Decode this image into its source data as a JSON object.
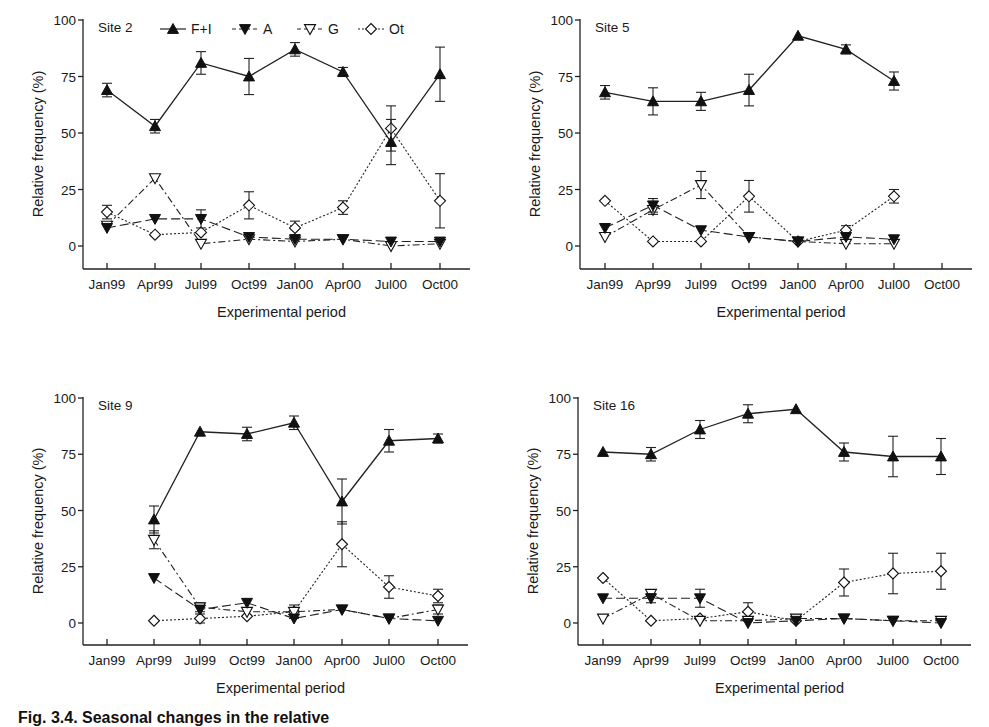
{
  "figure": {
    "caption": "Fig. 3.4. Seasonal changes in the relative"
  },
  "legend": {
    "entries": [
      {
        "key": "FI",
        "label": "F+I",
        "marker": "filled-triangle-up",
        "line": "solid"
      },
      {
        "key": "A",
        "label": "A",
        "marker": "filled-triangle-down",
        "line": "long-dash"
      },
      {
        "key": "G",
        "label": "G",
        "marker": "open-triangle-down",
        "line": "dash-dot"
      },
      {
        "key": "Ot",
        "label": "Ot",
        "marker": "open-diamond",
        "line": "dotted"
      }
    ]
  },
  "chart_data": [
    {
      "type": "line",
      "title": "Site 2",
      "xlabel": "Experimental period",
      "ylabel": "Relative frequency (%)",
      "ylim": [
        -10,
        100
      ],
      "yticks": [
        0,
        25,
        50,
        75,
        100
      ],
      "categories": [
        "Jan99",
        "Apr99",
        "Jul99",
        "Oct99",
        "Jan00",
        "Apr00",
        "Jul00",
        "Oct00"
      ],
      "grid": false,
      "legend_position": "top inside",
      "series": [
        {
          "name": "F+I",
          "values": [
            69,
            53,
            81,
            75,
            87,
            77,
            46,
            76
          ],
          "err": [
            3,
            3,
            5,
            8,
            3,
            2,
            10,
            12
          ]
        },
        {
          "name": "A",
          "values": [
            8,
            12,
            12,
            4,
            3,
            3,
            2,
            2
          ],
          "err": [
            0,
            0,
            4,
            0,
            0,
            0,
            0,
            0
          ]
        },
        {
          "name": "G",
          "values": [
            9,
            30,
            1,
            3,
            2,
            3,
            0,
            1
          ],
          "err": [
            0,
            0,
            0,
            0,
            0,
            0,
            0,
            0
          ]
        },
        {
          "name": "Ot",
          "values": [
            15,
            5,
            6,
            18,
            8,
            17,
            52,
            20
          ],
          "err": [
            3,
            0,
            0,
            6,
            3,
            3,
            10,
            12
          ]
        }
      ]
    },
    {
      "type": "line",
      "title": "Site 5",
      "xlabel": "Experimental period",
      "ylabel": "Relative frequency (%)",
      "ylim": [
        -10,
        100
      ],
      "yticks": [
        0,
        25,
        50,
        75,
        100
      ],
      "categories": [
        "Jan99",
        "Apr99",
        "Jul99",
        "Oct99",
        "Jan00",
        "Apr00",
        "Jul00",
        "Oct00"
      ],
      "grid": false,
      "series": [
        {
          "name": "F+I",
          "values": [
            68,
            64,
            64,
            69,
            93,
            87,
            73,
            null
          ],
          "err": [
            3,
            6,
            4,
            7,
            0,
            2,
            4,
            null
          ]
        },
        {
          "name": "A",
          "values": [
            8,
            18,
            7,
            4,
            2,
            4,
            3,
            null
          ],
          "err": [
            0,
            3,
            0,
            0,
            0,
            0,
            0,
            null
          ]
        },
        {
          "name": "G",
          "values": [
            4,
            16,
            27,
            4,
            2,
            1,
            1,
            null
          ],
          "err": [
            0,
            2,
            6,
            0,
            0,
            0,
            0,
            null
          ]
        },
        {
          "name": "Ot",
          "values": [
            20,
            2,
            2,
            22,
            2,
            7,
            22,
            null
          ],
          "err": [
            0,
            0,
            0,
            7,
            0,
            2,
            3,
            null
          ]
        }
      ]
    },
    {
      "type": "line",
      "title": "Site 9",
      "xlabel": "Experimental period",
      "ylabel": "Relative frequency (%)",
      "ylim": [
        -10,
        100
      ],
      "yticks": [
        0,
        25,
        50,
        75,
        100
      ],
      "categories": [
        "Jan99",
        "Apr99",
        "Jul99",
        "Oct99",
        "Jan00",
        "Apr00",
        "Jul00",
        "Oct00"
      ],
      "grid": false,
      "series": [
        {
          "name": "F+I",
          "values": [
            null,
            46,
            85,
            84,
            89,
            54,
            81,
            82
          ],
          "err": [
            null,
            6,
            0,
            3,
            3,
            10,
            5,
            2
          ]
        },
        {
          "name": "A",
          "values": [
            null,
            20,
            6,
            9,
            2,
            6,
            2,
            1
          ],
          "err": [
            null,
            0,
            0,
            0,
            0,
            0,
            0,
            0
          ]
        },
        {
          "name": "G",
          "values": [
            null,
            37,
            7,
            5,
            5,
            6,
            2,
            6
          ],
          "err": [
            null,
            4,
            2,
            0,
            0,
            0,
            0,
            2
          ]
        },
        {
          "name": "Ot",
          "values": [
            null,
            1,
            2,
            3,
            5,
            35,
            16,
            12
          ],
          "err": [
            null,
            0,
            2,
            0,
            3,
            10,
            5,
            3
          ]
        }
      ]
    },
    {
      "type": "line",
      "title": "Site 16",
      "xlabel": "Experimental period",
      "ylabel": "Relative frequency (%)",
      "ylim": [
        -10,
        100
      ],
      "yticks": [
        0,
        25,
        50,
        75,
        100
      ],
      "categories": [
        "Jan99",
        "Apr99",
        "Jul99",
        "Oct99",
        "Jan00",
        "Apr00",
        "Jul00",
        "Oct00"
      ],
      "grid": false,
      "series": [
        {
          "name": "F+I",
          "values": [
            76,
            75,
            86,
            93,
            95,
            76,
            74,
            74
          ],
          "err": [
            0,
            3,
            4,
            4,
            0,
            4,
            9,
            8
          ]
        },
        {
          "name": "A",
          "values": [
            11,
            11,
            11,
            0,
            1,
            2,
            1,
            0
          ],
          "err": [
            0,
            2,
            4,
            0,
            0,
            0,
            0,
            0
          ]
        },
        {
          "name": "G",
          "values": [
            2,
            13,
            1,
            1,
            2,
            2,
            1,
            1
          ],
          "err": [
            0,
            0,
            0,
            0,
            0,
            0,
            0,
            0
          ]
        },
        {
          "name": "Ot",
          "values": [
            20,
            1,
            2,
            5,
            1,
            18,
            22,
            23
          ],
          "err": [
            0,
            0,
            0,
            4,
            0,
            6,
            9,
            8
          ]
        }
      ]
    }
  ],
  "panels": [
    {
      "id": "site2",
      "title": "Site 2",
      "origin_x": 83,
      "y100": 20,
      "y0": 246,
      "axis_bottom": 269,
      "xticks": [
        107,
        155,
        201,
        249,
        295,
        343,
        391,
        440
      ],
      "show_legend": true
    },
    {
      "id": "site5",
      "title": "Site 5",
      "origin_x": 580,
      "y100": 20,
      "y0": 246,
      "axis_bottom": 269,
      "xticks": [
        605,
        653,
        701,
        749,
        798,
        846,
        894,
        942
      ],
      "show_legend": false
    },
    {
      "id": "site9",
      "title": "Site 9",
      "origin_x": 83,
      "y100": 398,
      "y0": 623,
      "axis_bottom": 645,
      "xticks": [
        107,
        154,
        200,
        247,
        294,
        342,
        389,
        438
      ],
      "show_legend": false
    },
    {
      "id": "site16",
      "title": "Site 16",
      "origin_x": 578,
      "y100": 398,
      "y0": 623,
      "axis_bottom": 645,
      "xticks": [
        603,
        651,
        700,
        748,
        796,
        844,
        893,
        941
      ],
      "show_legend": false
    }
  ]
}
